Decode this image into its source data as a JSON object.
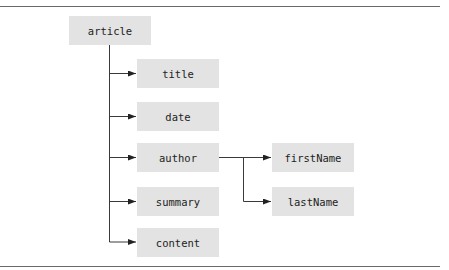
{
  "diagram": {
    "type": "tree",
    "root": {
      "id": "article",
      "label": "article"
    },
    "children": [
      {
        "id": "title",
        "label": "title"
      },
      {
        "id": "date",
        "label": "date"
      },
      {
        "id": "author",
        "label": "author",
        "children": [
          {
            "id": "firstName",
            "label": "firstName"
          },
          {
            "id": "lastName",
            "label": "lastName"
          }
        ]
      },
      {
        "id": "summary",
        "label": "summary"
      },
      {
        "id": "content",
        "label": "content"
      }
    ],
    "colors": {
      "node_fill": "#e3e3e3",
      "line": "#3a3a3a",
      "rule": "#6a6a6a"
    }
  },
  "nodes": {
    "article": "article",
    "title": "title",
    "date": "date",
    "author": "author",
    "summary": "summary",
    "content": "content",
    "firstName": "firstName",
    "lastName": "lastName"
  }
}
